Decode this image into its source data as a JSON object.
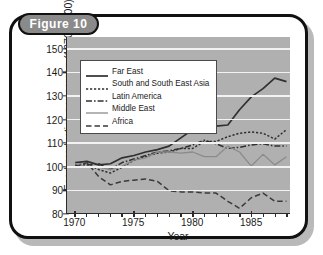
{
  "figure": {
    "badge_label": "Figure 10"
  },
  "chart_data": {
    "type": "line",
    "title": "Figure 10",
    "xlabel": "Year",
    "ylabel": "Food production per person (1970 = 100)",
    "xlim": [
      1969.3,
      1988.3
    ],
    "ylim": [
      80,
      155
    ],
    "ytick_labels": [
      "150",
      "140",
      "130",
      "120",
      "110",
      "100",
      "90",
      "80"
    ],
    "yticks": [
      150,
      140,
      130,
      120,
      110,
      100,
      90,
      80
    ],
    "xtick_labels": [
      "1970",
      "1975",
      "1980",
      "1985"
    ],
    "xticks": [
      1970,
      1975,
      1980,
      1985
    ],
    "x_minor_ticks": [
      1970,
      1971,
      1972,
      1973,
      1974,
      1975,
      1976,
      1977,
      1978,
      1979,
      1980,
      1981,
      1982,
      1983,
      1984,
      1985,
      1986,
      1987,
      1988
    ],
    "grid": "horizontal-white",
    "legend_position": "upper-left-inside",
    "plot_background": "#b0b0b0",
    "x": [
      1970,
      1971,
      1972,
      1973,
      1974,
      1975,
      1976,
      1977,
      1978,
      1979,
      1980,
      1981,
      1982,
      1983,
      1984,
      1985,
      1986,
      1987,
      1988
    ],
    "series": [
      {
        "name": "Far East",
        "style": "solid",
        "color": "#303030",
        "width": 1.7,
        "values": [
          101.5,
          102.0,
          100.5,
          101.0,
          103.5,
          104.5,
          106.0,
          107.0,
          108.5,
          112.0,
          115.5,
          115.5,
          117.0,
          117.5,
          124.0,
          129.5,
          133.0,
          137.5,
          136.0
        ]
      },
      {
        "name": "South and South East Asia",
        "style": "dotted",
        "color": "#2f2f2f",
        "width": 1.5,
        "values": [
          100.5,
          101.0,
          98.5,
          97.0,
          99.5,
          102.5,
          104.0,
          105.5,
          106.0,
          107.5,
          107.5,
          110.5,
          110.5,
          112.5,
          114.0,
          114.5,
          114.0,
          111.5,
          115.5
        ]
      },
      {
        "name": "Latin America",
        "style": "dashdot",
        "color": "#303030",
        "width": 1.5,
        "values": [
          100.0,
          100.5,
          101.0,
          98.5,
          101.5,
          103.0,
          104.5,
          106.0,
          106.5,
          107.5,
          109.0,
          111.0,
          109.5,
          107.5,
          108.0,
          109.0,
          109.5,
          108.5,
          108.5
        ]
      },
      {
        "name": "Middle East",
        "style": "solid",
        "color": "#8b8b8b",
        "width": 1.3,
        "values": [
          101.0,
          99.5,
          99.5,
          98.5,
          100.0,
          102.5,
          103.5,
          106.0,
          106.0,
          105.5,
          106.0,
          104.0,
          104.0,
          108.5,
          106.0,
          100.0,
          105.0,
          100.5,
          104.0
        ]
      },
      {
        "name": "Africa",
        "style": "dashed",
        "color": "#3a3a3a",
        "width": 1.5,
        "values": [
          99.5,
          101.5,
          95.5,
          92.0,
          93.5,
          94.0,
          94.5,
          93.5,
          89.5,
          89.0,
          89.0,
          88.5,
          88.5,
          85.0,
          82.0,
          86.5,
          88.5,
          85.0,
          85.0
        ]
      }
    ]
  },
  "legend": {
    "entries": [
      {
        "label": "Far East"
      },
      {
        "label": "South and South East Asia"
      },
      {
        "label": "Latin America"
      },
      {
        "label": "Middle East"
      },
      {
        "label": "Africa"
      }
    ]
  }
}
